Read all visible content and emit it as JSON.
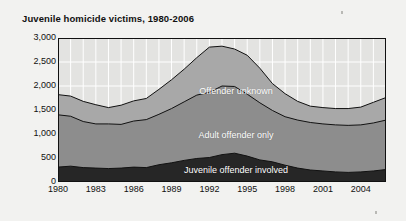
{
  "chart_title": "Juvenile homicide victims, 1980-2006",
  "axes": {
    "y_ticks": [
      "0",
      "500",
      "1,000",
      "1,500",
      "2,000",
      "2,500",
      "3,000"
    ],
    "x_ticks": [
      "1980",
      "1983",
      "1986",
      "1989",
      "1992",
      "1995",
      "1998",
      "2001",
      "2004"
    ]
  },
  "series_labels": {
    "unknown": "Offender unknown",
    "adult": "Adult offender only",
    "juvenile": "Juvenile offender involved"
  },
  "colors": {
    "page_background": "#f2f2f0",
    "plot_background": "#e3e3e1",
    "gridline": "#ffffff",
    "juvenile": "#262626",
    "adult": "#8d8d8d",
    "unknown": "#a8a8a8",
    "outline": "#111111",
    "label_text": "#ffffff",
    "axis_text": "#111111"
  },
  "chart_data": {
    "type": "area",
    "title": "Juvenile homicide victims, 1980-2006",
    "subtitle": "",
    "xlabel": "",
    "ylabel": "",
    "stacked": true,
    "grid": true,
    "legend_position": "inline-labels",
    "xlim": [
      1980,
      2006
    ],
    "ylim": [
      0,
      3000
    ],
    "y_tick_values": [
      0,
      500,
      1000,
      1500,
      2000,
      2500,
      3000
    ],
    "x_tick_values": [
      1980,
      1983,
      1986,
      1989,
      1992,
      1995,
      1998,
      2001,
      2004
    ],
    "x": [
      1980,
      1981,
      1982,
      1983,
      1984,
      1985,
      1986,
      1987,
      1988,
      1989,
      1990,
      1991,
      1992,
      1993,
      1994,
      1995,
      1996,
      1997,
      1998,
      1999,
      2000,
      2001,
      2002,
      2003,
      2004,
      2005,
      2006
    ],
    "series": [
      {
        "name": "Juvenile offender involved",
        "values": [
          310,
          330,
          300,
          290,
          280,
          290,
          310,
          300,
          360,
          400,
          450,
          490,
          510,
          570,
          600,
          540,
          460,
          420,
          350,
          290,
          250,
          230,
          210,
          200,
          210,
          230,
          260
        ]
      },
      {
        "name": "Adult offender only",
        "values": [
          1090,
          1040,
          960,
          920,
          930,
          910,
          960,
          1000,
          1050,
          1130,
          1220,
          1320,
          1360,
          1430,
          1390,
          1290,
          1190,
          1070,
          1010,
          1000,
          990,
          980,
          980,
          980,
          980,
          1000,
          1030
        ]
      },
      {
        "name": "Offender unknown",
        "values": [
          420,
          420,
          420,
          400,
          340,
          400,
          420,
          440,
          520,
          600,
          680,
          780,
          940,
          830,
          780,
          810,
          720,
          560,
          480,
          390,
          340,
          340,
          340,
          350,
          370,
          430,
          470
        ]
      }
    ],
    "totals": [
      1820,
      1790,
      1680,
      1610,
      1550,
      1600,
      1690,
      1740,
      1930,
      2130,
      2350,
      2590,
      2810,
      2830,
      2770,
      2640,
      2370,
      2050,
      1840,
      1680,
      1580,
      1550,
      1530,
      1530,
      1560,
      1660,
      1760
    ]
  }
}
